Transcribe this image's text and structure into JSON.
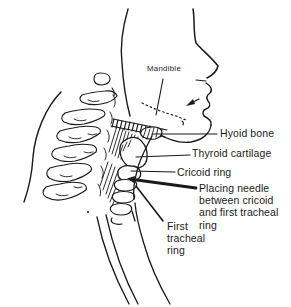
{
  "figure": {
    "colors": {
      "ink": "#1a1a1a",
      "background": "#ffffff"
    },
    "labels": {
      "mandible": "Mandible",
      "hyoid": "Hyoid bone",
      "thyroid": "Thyroid cartilage",
      "cricoid": "Cricoid ring",
      "needle": "Placing needle between cricoid and first tracheal ring",
      "first_tracheal": "First tracheal ring"
    }
  }
}
